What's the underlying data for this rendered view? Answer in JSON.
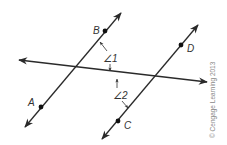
{
  "diagram": {
    "points": {
      "A": {
        "label": "A"
      },
      "B": {
        "label": "B"
      },
      "C": {
        "label": "C"
      },
      "D": {
        "label": "D"
      }
    },
    "angles": {
      "angle1": {
        "label": "∠1"
      },
      "angle2": {
        "label": "∠2"
      }
    },
    "colors": {
      "line": "#2a2a2a",
      "text": "#333333",
      "copyright": "#888888"
    }
  },
  "copyright": "© Cengage Learning 2013"
}
